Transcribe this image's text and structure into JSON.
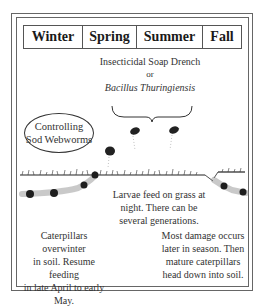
{
  "seasons": [
    "Winter",
    "Spring",
    "Summer",
    "Fall"
  ],
  "treatment": {
    "line1": "Insecticidal Soap Drench",
    "line2": "or",
    "line3": "Bacillus Thuringiensis"
  },
  "title": {
    "line1": "Controlling",
    "line2": "Sod Webworms"
  },
  "larvae_note": {
    "line1": "Larvae feed on grass at",
    "line2": "night. There can be",
    "line3": "several generations."
  },
  "winter_note": {
    "line1": "Caterpillars overwinter",
    "line2": "in soil. Resume feeding",
    "line3": "in late April to early",
    "line4": "May."
  },
  "fall_note": {
    "line1": "Most damage occurs",
    "line2": "later in season. Then",
    "line3": "mature caterpillars",
    "line4": "head down into soil."
  },
  "colors": {
    "ink": "#222222",
    "frame": "#666666",
    "background": "#ffffff"
  }
}
